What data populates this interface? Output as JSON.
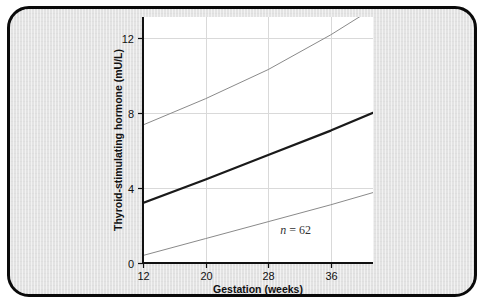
{
  "figure": {
    "background_color": "#e3e3e3",
    "border_color": "#0a0a0a",
    "plot_background": "#ffffff"
  },
  "chart_data": {
    "type": "line",
    "title": "",
    "subtitle": "",
    "xlabel": "Gestation (weeks)",
    "ylabel": "Thyroid-stimulating hormone (mU/L)",
    "xlim": [
      12,
      41.4
    ],
    "ylim": [
      0,
      13.1
    ],
    "xticks": [
      12,
      20,
      28,
      36
    ],
    "xticklabels": [
      "12",
      "20",
      "28",
      "36"
    ],
    "yticks": [
      0,
      4,
      8,
      12
    ],
    "yticklabels": [
      "0",
      "4",
      "8",
      "12"
    ],
    "grid": true,
    "grid_color": "#d9d9d9",
    "legend": "none",
    "annotations": [
      {
        "name": "sample-size",
        "text_italic": "n",
        "text_rest": " = 62",
        "text": "n = 62",
        "x": 31.5,
        "y": 1.55
      }
    ],
    "series": [
      {
        "name": "upper-reference-limit",
        "style": "thin",
        "color": "#8a8a8a",
        "width": 1,
        "x": [
          12,
          20,
          28,
          36,
          40.6
        ],
        "values": [
          7.35,
          8.75,
          10.3,
          12.15,
          13.35
        ]
      },
      {
        "name": "mean-regression-line",
        "style": "bold",
        "color": "#1a1a1a",
        "width": 2.2,
        "x": [
          12,
          20,
          28,
          36,
          41.4
        ],
        "values": [
          3.2,
          4.45,
          5.75,
          7.05,
          8.0
        ]
      },
      {
        "name": "lower-reference-limit",
        "style": "thin",
        "color": "#8a8a8a",
        "width": 1,
        "x": [
          12,
          20,
          28,
          36,
          41.4
        ],
        "values": [
          0.4,
          1.3,
          2.2,
          3.1,
          3.75
        ]
      }
    ]
  }
}
